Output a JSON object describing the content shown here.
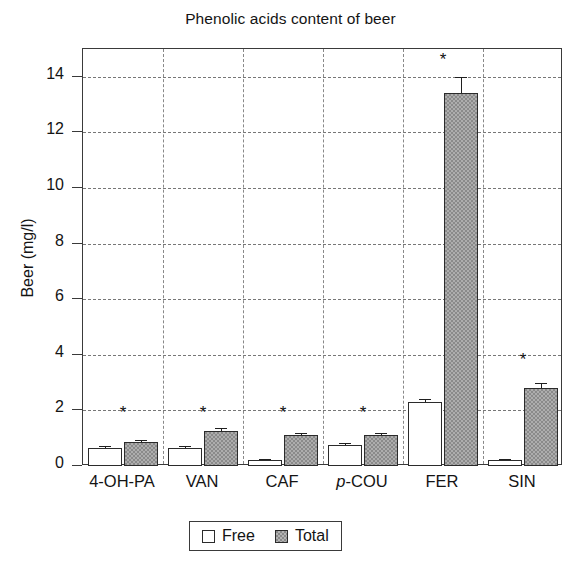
{
  "chart_data": {
    "type": "bar",
    "title": "Phenolic acids content of beer",
    "xlabel": "",
    "ylabel": "Beer (mg/l)",
    "ylim": [
      0,
      15
    ],
    "yticks": [
      0,
      2,
      4,
      6,
      8,
      10,
      12,
      14
    ],
    "grid": true,
    "legend_position": "bottom-center",
    "categories": [
      "4-OH-PA",
      "VAN",
      "CAF",
      "p-COU",
      "FER",
      "SIN"
    ],
    "categories_display": [
      {
        "italic_prefix": "",
        "text": "4-OH-PA"
      },
      {
        "italic_prefix": "",
        "text": "VAN"
      },
      {
        "italic_prefix": "",
        "text": "CAF"
      },
      {
        "italic_prefix": "p",
        "text": "-COU"
      },
      {
        "italic_prefix": "",
        "text": "FER"
      },
      {
        "italic_prefix": "",
        "text": "SIN"
      }
    ],
    "series": [
      {
        "name": "Free",
        "color": "#ffffff",
        "values": [
          0.65,
          0.65,
          0.2,
          0.75,
          2.3,
          0.2
        ],
        "errors": [
          0.07,
          0.07,
          0.04,
          0.07,
          0.12,
          0.06
        ]
      },
      {
        "name": "Total",
        "color": "#8a8a8a",
        "values": [
          0.85,
          1.25,
          1.1,
          1.1,
          13.4,
          2.8
        ],
        "errors": [
          0.1,
          0.1,
          0.08,
          0.08,
          0.6,
          0.18
        ]
      }
    ],
    "annotations": [
      {
        "category": "4-OH-PA",
        "symbol": "*",
        "y": 1.9
      },
      {
        "category": "VAN",
        "symbol": "*",
        "y": 1.9
      },
      {
        "category": "CAF",
        "symbol": "*",
        "y": 1.9
      },
      {
        "category": "p-COU",
        "symbol": "*",
        "y": 1.9
      },
      {
        "category": "FER",
        "symbol": "*",
        "y": 14.6
      },
      {
        "category": "SIN",
        "symbol": "*",
        "y": 3.8
      }
    ]
  },
  "legend": {
    "items": [
      {
        "label": "Free",
        "swatch": "open-square"
      },
      {
        "label": "Total",
        "swatch": "filled-square"
      }
    ]
  },
  "axis": {
    "y_tick_labels": [
      "0",
      "2",
      "4",
      "6",
      "8",
      "10",
      "12",
      "14"
    ]
  }
}
